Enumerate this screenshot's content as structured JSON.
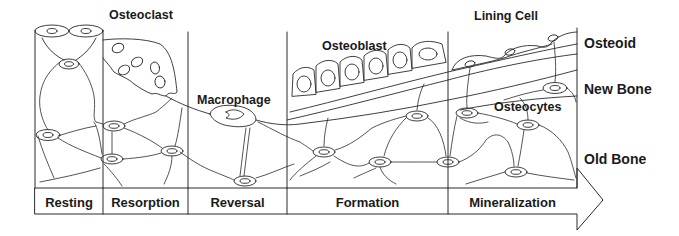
{
  "diagram": {
    "cell_labels": {
      "osteoclast": "Osteoclast",
      "macrophage": "Macrophage",
      "osteoblast": "Osteoblast",
      "lining_cell": "Lining Cell",
      "osteocytes": "Osteocytes"
    },
    "layer_labels": {
      "osteoid": "Osteoid",
      "new_bone": "New Bone",
      "old_bone": "Old Bone"
    },
    "phases": [
      {
        "label": "Resting"
      },
      {
        "label": "Resorption"
      },
      {
        "label": "Reversal"
      },
      {
        "label": "Formation"
      },
      {
        "label": "Mineralization"
      }
    ],
    "colors": {
      "line": "#2a2a2a",
      "background": "#ffffff",
      "text": "#1a1a1a"
    }
  }
}
